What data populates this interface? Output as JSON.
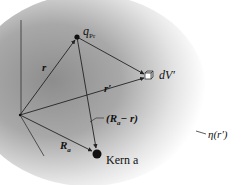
{
  "diagram": {
    "type": "vector-geometry",
    "colors": {
      "line": "#222222",
      "cloud_dark": "#8a8a8a",
      "cloud_light": "#ffffff"
    },
    "nodes": {
      "origin": {
        "x": 20,
        "y": 115
      },
      "charge": {
        "x": 77,
        "y": 37,
        "label": "q",
        "subscript": "Pr"
      },
      "volume": {
        "x": 148,
        "y": 76,
        "label": "dV′"
      },
      "nucleus": {
        "x": 97,
        "y": 154,
        "label": "Kern a"
      }
    },
    "vectors": [
      {
        "from": "origin",
        "to": "charge",
        "label": "r"
      },
      {
        "from": "origin",
        "to": "volume",
        "label": "r′"
      },
      {
        "from": "charge",
        "to": "volume",
        "label": ""
      },
      {
        "from": "origin",
        "to": "nucleus",
        "label": "R",
        "subscript": "a"
      },
      {
        "from": "charge",
        "to": "nucleus",
        "label": "(R",
        "subscript": "a",
        "suffix": " − r)"
      }
    ],
    "labels": {
      "r": "r",
      "r_prime": "r′",
      "q": "q",
      "q_sub": "Pr",
      "dV": "dV′",
      "Ra": "R",
      "Ra_sub": "a",
      "diff_open": "(R",
      "diff_sub": "a",
      "diff_close": "− r)",
      "kern": "Kern a",
      "eta": "η(r′)"
    }
  }
}
